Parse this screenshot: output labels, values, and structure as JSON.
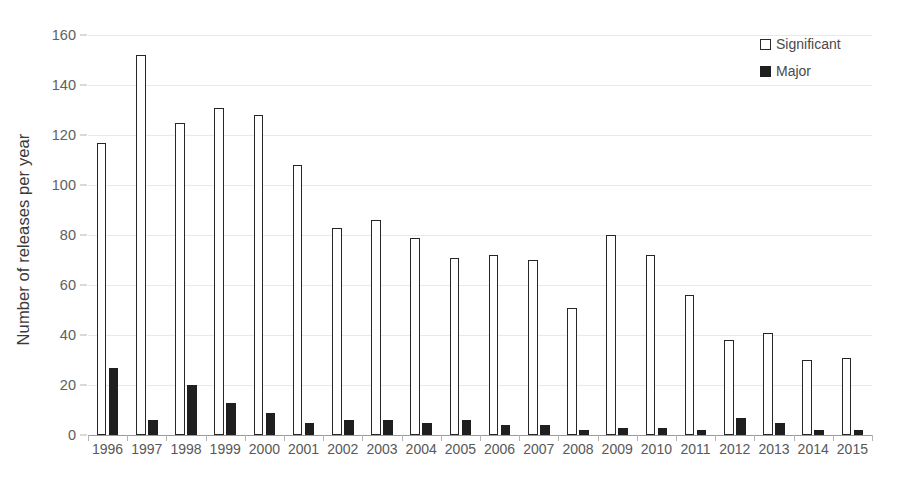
{
  "chart_data": {
    "type": "bar",
    "title": "",
    "xlabel": "",
    "ylabel": "Number of releases per year",
    "ylim": [
      0,
      160
    ],
    "ytick_step": 20,
    "yticks": [
      0,
      20,
      40,
      60,
      80,
      100,
      120,
      140,
      160
    ],
    "grid": true,
    "legend_position": "top-right",
    "categories": [
      "1996",
      "1997",
      "1998",
      "1999",
      "2000",
      "2001",
      "2002",
      "2003",
      "2004",
      "2005",
      "2006",
      "2007",
      "2008",
      "2009",
      "2010",
      "2011",
      "2012",
      "2013",
      "2014",
      "2015"
    ],
    "series": [
      {
        "name": "Significant",
        "color": "#ffffff",
        "edge_color": "#262626",
        "values": [
          117,
          152,
          125,
          131,
          128,
          108,
          83,
          86,
          79,
          71,
          72,
          70,
          51,
          80,
          72,
          56,
          38,
          41,
          30,
          31
        ]
      },
      {
        "name": "Major",
        "color": "#1f1f1f",
        "edge_color": "#1f1f1f",
        "values": [
          27,
          6,
          20,
          13,
          9,
          5,
          6,
          6,
          5,
          6,
          4,
          4,
          2,
          3,
          3,
          2,
          7,
          5,
          2,
          2
        ]
      }
    ]
  },
  "legend": {
    "items": [
      {
        "label": "Significant",
        "style": "hollow"
      },
      {
        "label": "Major",
        "style": "solid"
      }
    ]
  },
  "colors": {
    "bar_edge": "#262626",
    "bar_fill_major": "#1f1f1f",
    "gridline": "#e9e9e9",
    "axis": "#9a9a9a",
    "text": "#4a4a4a"
  }
}
